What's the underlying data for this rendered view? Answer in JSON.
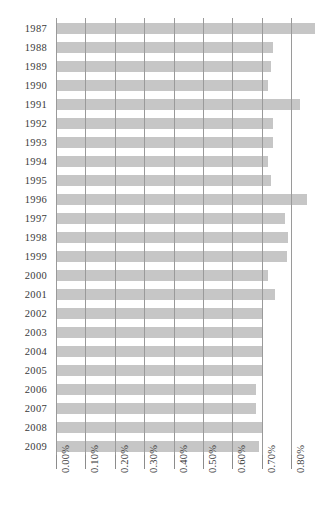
{
  "chart_data": {
    "type": "bar",
    "orientation": "horizontal",
    "title": "",
    "xlabel": "",
    "ylabel": "",
    "xlim": [
      0.0,
      0.9
    ],
    "grid": true,
    "legend": false,
    "bar_color": "#c6c6c6",
    "gridline_color": "#9a9a9a",
    "text_color": "#3a3a3a",
    "xticks": [
      "0.00%",
      "0.10%",
      "0.20%",
      "0.30%",
      "0.40%",
      "0.50%",
      "0.60%",
      "0.70%",
      "0.80%",
      "0.90%"
    ],
    "xtick_values": [
      0.0,
      0.1,
      0.2,
      0.3,
      0.4,
      0.5,
      0.6,
      0.7,
      0.8,
      0.9
    ],
    "categories": [
      "1987",
      "1988",
      "1989",
      "1990",
      "1991",
      "1992",
      "1993",
      "1994",
      "1995",
      "1996",
      "1997",
      "1998",
      "1999",
      "2000",
      "2001",
      "2002",
      "2003",
      "2004",
      "2005",
      "2006",
      "2007",
      "2008",
      "2009"
    ],
    "values": [
      0.88,
      0.74,
      0.73,
      0.72,
      0.83,
      0.74,
      0.74,
      0.72,
      0.73,
      0.855,
      0.78,
      0.79,
      0.785,
      0.72,
      0.745,
      0.7,
      0.7,
      0.7,
      0.7,
      0.68,
      0.68,
      0.7,
      0.69
    ]
  }
}
